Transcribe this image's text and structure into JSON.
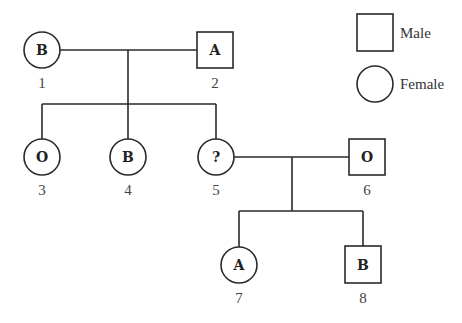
{
  "diagram": {
    "type": "pedigree",
    "legend": {
      "male_label": "Male",
      "female_label": "Female"
    },
    "individuals": [
      {
        "id": "1",
        "sex": "female",
        "blood_type": "B"
      },
      {
        "id": "2",
        "sex": "male",
        "blood_type": "A"
      },
      {
        "id": "3",
        "sex": "female",
        "blood_type": "O"
      },
      {
        "id": "4",
        "sex": "female",
        "blood_type": "B"
      },
      {
        "id": "5",
        "sex": "female",
        "blood_type": "?"
      },
      {
        "id": "6",
        "sex": "male",
        "blood_type": "O"
      },
      {
        "id": "7",
        "sex": "female",
        "blood_type": "A"
      },
      {
        "id": "8",
        "sex": "male",
        "blood_type": "B"
      }
    ],
    "couples": [
      {
        "partners": [
          "1",
          "2"
        ],
        "children": [
          "3",
          "4",
          "5"
        ]
      },
      {
        "partners": [
          "5",
          "6"
        ],
        "children": [
          "7",
          "8"
        ]
      }
    ]
  }
}
